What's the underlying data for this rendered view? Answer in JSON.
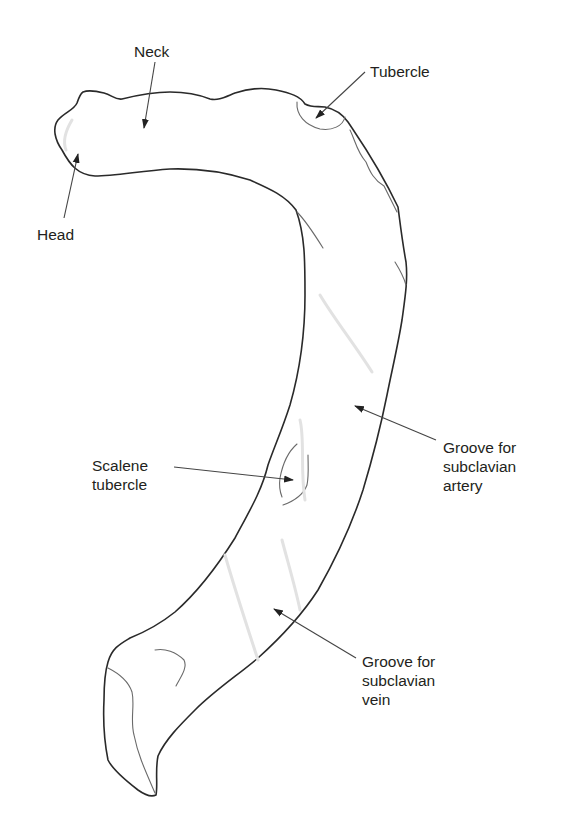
{
  "figure": {
    "labels": [
      {
        "id": "neck",
        "text": "Neck"
      },
      {
        "id": "tubercle",
        "text": "Tubercle"
      },
      {
        "id": "head",
        "text": "Head"
      },
      {
        "id": "scalene",
        "lines": [
          "Scalene",
          "tubercle"
        ]
      },
      {
        "id": "artery",
        "lines": [
          "Groove for",
          "subclavian",
          "artery"
        ]
      },
      {
        "id": "vein",
        "lines": [
          "Groove for",
          "subclavian",
          "vein"
        ]
      }
    ]
  },
  "colors": {
    "background": "#ffffff",
    "outline": "#2a2a2a",
    "text": "#231f20"
  }
}
